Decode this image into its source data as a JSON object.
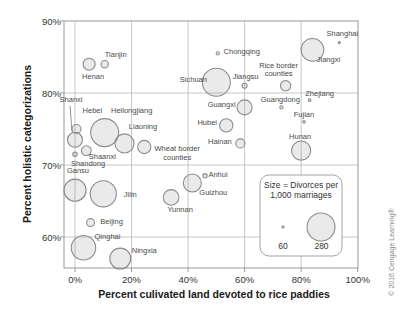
{
  "figure": {
    "copyright": "© 2016 Cengage Learning®"
  },
  "chart_data": {
    "type": "scatter",
    "subtype": "bubble",
    "title": "",
    "xlabel": "Percent culivated land devoted to rice paddies",
    "ylabel": "Percent holistic categorizations",
    "x_tick_labels": [
      "0%",
      "20%",
      "40%",
      "60%",
      "80%",
      "100%"
    ],
    "x_tick_values": [
      0,
      20,
      40,
      60,
      80,
      100
    ],
    "y_tick_labels": [
      "90%",
      "80%",
      "70%",
      "60%"
    ],
    "y_tick_values": [
      90,
      80,
      70,
      60
    ],
    "xlim": [
      -4,
      100
    ],
    "ylim": [
      55.7,
      90
    ],
    "grid": true,
    "size_legend": {
      "line1": "Size = Divorces per",
      "line2": "1,000 marriages",
      "small_value": 60,
      "small_label": "60",
      "large_value": 280,
      "large_label": "280",
      "position": "bottom-right"
    },
    "points": [
      {
        "name": "Shanghai",
        "x": 93.5,
        "y": 87,
        "size": 60,
        "label_dx": 3,
        "label_dy": -9
      },
      {
        "name": "Jiangxi",
        "x": 84,
        "y": 86,
        "size": 235,
        "label_dx": 16,
        "label_dy": 10
      },
      {
        "name": "Chongqing",
        "x": 50.5,
        "y": 85.5,
        "size": 70,
        "label_dx": 24,
        "label_dy": -1.5
      },
      {
        "name": "Tianjin",
        "x": 10.5,
        "y": 84,
        "size": 105,
        "label_dx": 11,
        "label_dy": -9
      },
      {
        "name": "Henan",
        "x": 5,
        "y": 84,
        "size": 145,
        "label_dx": 4,
        "label_dy": 13
      },
      {
        "name": "Sichuan",
        "x": 50,
        "y": 81.5,
        "size": 280,
        "label_dx": -23,
        "label_dy": -2
      },
      {
        "name": "Jiangsu",
        "x": 60,
        "y": 81,
        "size": 85,
        "label_dx": 1,
        "label_dy": -9
      },
      {
        "name": "Rice border\ncounties",
        "x": 74.5,
        "y": 81,
        "size": 130,
        "label_dx": -7,
        "label_dy": -16
      },
      {
        "name": "Zhejiang",
        "x": 83,
        "y": 79,
        "size": 65,
        "label_dx": 10,
        "label_dy": -6
      },
      {
        "name": "Guangdong",
        "x": 73,
        "y": 78,
        "size": 70,
        "label_dx": -1,
        "label_dy": -7
      },
      {
        "name": "Guangxi",
        "x": 60,
        "y": 78,
        "size": 170,
        "label_dx": -23,
        "label_dy": -2
      },
      {
        "name": "Fujian",
        "x": 81,
        "y": 76,
        "size": 65,
        "label_dx": 0,
        "label_dy": -7
      },
      {
        "name": "Hubei",
        "x": 53.5,
        "y": 75.5,
        "size": 155,
        "label_dx": -19,
        "label_dy": -2.5
      },
      {
        "name": "Hainan",
        "x": 58.5,
        "y": 73,
        "size": 120,
        "label_dx": -20.5,
        "label_dy": -1.5
      },
      {
        "name": "Hunan",
        "x": 80,
        "y": 72,
        "size": 205,
        "label_dx": -1,
        "label_dy": -14
      },
      {
        "name": "Shanxi",
        "x": 0,
        "y": 73.5,
        "size": 170,
        "label_dx": -4,
        "label_dy": -40,
        "leader": true
      },
      {
        "name": "Hebei",
        "x": 0.5,
        "y": 75,
        "size": 120,
        "label_dx": 16,
        "label_dy": -18
      },
      {
        "name": "Heilongjiang",
        "x": 10.5,
        "y": 74.5,
        "size": 280,
        "label_dx": 27,
        "label_dy": -22
      },
      {
        "name": "Liaoning",
        "x": 17.5,
        "y": 73,
        "size": 205,
        "label_dx": 18.5,
        "label_dy": -16
      },
      {
        "name": "Wheat border\ncounties",
        "x": 24.5,
        "y": 72.5,
        "size": 155,
        "label_dx": 33,
        "label_dy": 6
      },
      {
        "name": "Shaanxi",
        "x": 4,
        "y": 72,
        "size": 125,
        "label_dx": 16,
        "label_dy": 6
      },
      {
        "name": "Shandong",
        "x": 0,
        "y": 71.5,
        "size": 80,
        "label_dx": 13,
        "label_dy": 10
      },
      {
        "name": "Gansu",
        "x": 0,
        "y": 66.5,
        "size": 230,
        "label_dx": 3,
        "label_dy": -19.5
      },
      {
        "name": "Jilin",
        "x": 10,
        "y": 66,
        "size": 265,
        "label_dx": 27,
        "label_dy": 1
      },
      {
        "name": "Beijing",
        "x": 5.5,
        "y": 62,
        "size": 110,
        "label_dx": 21,
        "label_dy": -1
      },
      {
        "name": "Qinghai",
        "x": 3,
        "y": 58.5,
        "size": 250,
        "label_dx": 24,
        "label_dy": -11
      },
      {
        "name": "Ningxia",
        "x": 16,
        "y": 57,
        "size": 220,
        "label_dx": 24,
        "label_dy": -8
      },
      {
        "name": "Yunnan",
        "x": 34,
        "y": 65.5,
        "size": 175,
        "label_dx": 9,
        "label_dy": 13
      },
      {
        "name": "Guizhou",
        "x": 41.5,
        "y": 67.5,
        "size": 195,
        "label_dx": 21,
        "label_dy": 10
      },
      {
        "name": "Anhui",
        "x": 46,
        "y": 68.5,
        "size": 80,
        "label_dx": 13,
        "label_dy": -1
      }
    ]
  }
}
